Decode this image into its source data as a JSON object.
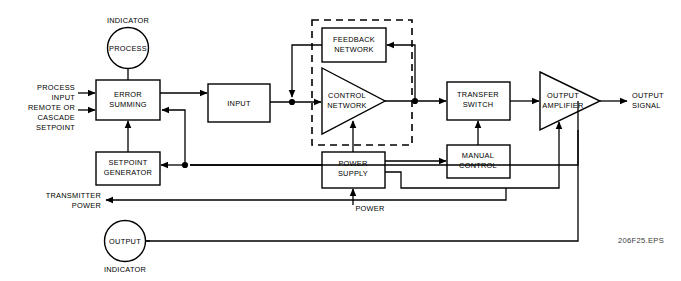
{
  "diagram": {
    "caption": "206F25.EPS",
    "stroke_color": "#000000",
    "fill_color": "#ffffff",
    "caption_color": "#3a3a3a",
    "blocks": {
      "error_summing": {
        "line1": "ERROR",
        "line2": "SUMMING"
      },
      "input": {
        "line1": "INPUT"
      },
      "feedback_network": {
        "line1": "FEEDBACK",
        "line2": "NETWORK"
      },
      "control_network": {
        "line1": "CONTROL",
        "line2": "NETWORK"
      },
      "transfer_switch": {
        "line1": "TRANSFER",
        "line2": "SWITCH"
      },
      "output_amplifier": {
        "line1": "OUTPUT",
        "line2": "AMPLIFIER"
      },
      "manual_control": {
        "line1": "MANUAL",
        "line2": "CONTROL"
      },
      "power_supply": {
        "line1": "POWER",
        "line2": "SUPPLY"
      },
      "setpoint_generator": {
        "line1": "SETPOINT",
        "line2": "GENERATOR"
      }
    },
    "indicators": {
      "process": {
        "caption": "INDICATOR",
        "label": "PROCESS"
      },
      "output": {
        "label": "OUTPUT",
        "caption": "INDICATOR"
      }
    },
    "io_labels": {
      "process_input": {
        "line1": "PROCESS",
        "line2": "INPUT"
      },
      "remote_setpoint": {
        "line1": "REMOTE OR",
        "line2": "CASCADE",
        "line3": "SETPOINT"
      },
      "transmitter_power": {
        "line1": "TRANSMITTER",
        "line2": "POWER"
      },
      "power_in": {
        "line1": "POWER"
      },
      "output_signal": {
        "line1": "OUTPUT",
        "line2": "SIGNAL"
      }
    }
  }
}
